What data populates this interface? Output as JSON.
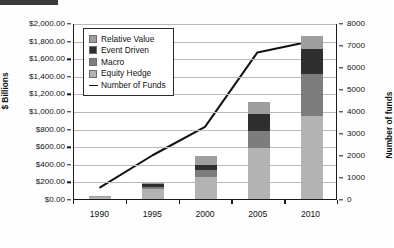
{
  "chart_data": {
    "type": "bar",
    "subtype": "stacked-bar-with-line",
    "title": "",
    "xlabel": "",
    "ylabel": "$ Billions",
    "y2label": "Number of funds",
    "categories": [
      "1990",
      "1995",
      "2000",
      "2005",
      "2010"
    ],
    "ylim": [
      0,
      2000
    ],
    "y2lim": [
      0,
      8000
    ],
    "ytick_step": 200,
    "y2tick_step": 1000,
    "yticks": [
      "$0.00",
      "$200.00",
      "$400.00",
      "$600.00",
      "$800.00",
      "$1,000.00",
      "$1,200.00",
      "$1,400.00",
      "$1,600.00",
      "$1,800.00",
      "$2,000.00"
    ],
    "y2ticks": [
      "0",
      "1000",
      "2000",
      "3000",
      "4000",
      "5000",
      "6000",
      "7000",
      "8000"
    ],
    "grid": true,
    "legend_position": "upper-left-inside",
    "stack_order_bottom_to_top": [
      "Equity Hedge",
      "Macro",
      "Event Driven",
      "Relative Value"
    ],
    "series": [
      {
        "name": "Equity Hedge",
        "axis": "left",
        "color": "#b3b3b3",
        "values": [
          20,
          110,
          250,
          580,
          940
        ]
      },
      {
        "name": "Macro",
        "axis": "left",
        "color": "#7d7d7d",
        "values": [
          10,
          30,
          80,
          190,
          480
        ]
      },
      {
        "name": "Event Driven",
        "axis": "left",
        "color": "#2e2e2e",
        "values": [
          6,
          26,
          60,
          200,
          290
        ]
      },
      {
        "name": "Relative Value",
        "axis": "left",
        "color": "#9e9e9e",
        "values": [
          3,
          20,
          101,
          135,
          140
        ]
      },
      {
        "name": "Number of Funds",
        "axis": "right",
        "color": "#111111",
        "type": "line",
        "values": [
          530,
          2000,
          3300,
          6700,
          7200
        ]
      }
    ],
    "totals": [
      39,
      186,
      491,
      1105,
      1850
    ]
  },
  "legend": {
    "items": [
      {
        "label": "Relative Value",
        "swatch": "#9e9e9e",
        "kind": "box"
      },
      {
        "label": "Event Driven",
        "swatch": "#2e2e2e",
        "kind": "box"
      },
      {
        "label": "Macro",
        "swatch": "#7d7d7d",
        "kind": "box"
      },
      {
        "label": "Equity Hedge",
        "swatch": "#b3b3b3",
        "kind": "box"
      },
      {
        "label": "Number of Funds",
        "swatch": "#111111",
        "kind": "line"
      }
    ]
  }
}
